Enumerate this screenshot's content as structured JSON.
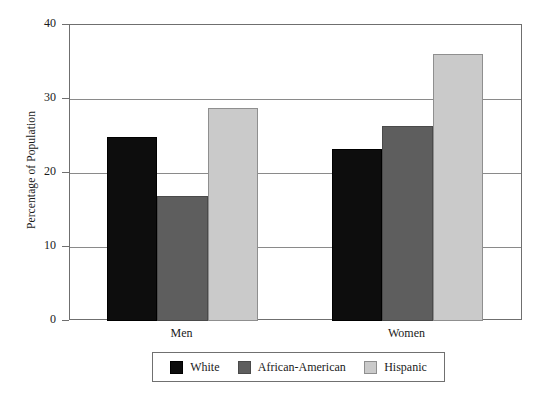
{
  "chart_data": {
    "type": "bar",
    "title": "",
    "subtitle": "",
    "xlabel": "",
    "ylabel": "Percentage of Population",
    "categories": [
      "Men",
      "Women"
    ],
    "series": [
      {
        "name": "White",
        "values": [
          24.8,
          23.2
        ],
        "color": "#0d0d0d"
      },
      {
        "name": "African-American",
        "values": [
          16.9,
          26.4
        ],
        "color": "#5e5e5e"
      },
      {
        "name": "Hispanic",
        "values": [
          28.8,
          36.1
        ],
        "color": "#cacaca"
      }
    ],
    "ylim": [
      0,
      40
    ],
    "yticks": [
      0,
      10,
      20,
      30,
      40
    ],
    "ytick_labels": [
      "0",
      "10",
      "20",
      "30",
      "40"
    ],
    "grid": true,
    "grid_axis": "y",
    "legend_position": "bottom",
    "grouping": "grouped",
    "bar_gap": 0
  },
  "legend": {
    "items": [
      {
        "label": "White",
        "color": "#0d0d0d"
      },
      {
        "label": "African-American",
        "color": "#5e5e5e"
      },
      {
        "label": "Hispanic",
        "color": "#cacaca"
      }
    ]
  },
  "axes": {
    "y_title": "Percentage of Population",
    "y_tick_labels": [
      "40",
      "30",
      "20",
      "10",
      "0"
    ],
    "x_tick_labels": [
      "Men",
      "Women"
    ]
  }
}
